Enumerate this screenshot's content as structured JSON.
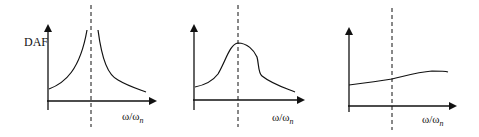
{
  "figure": {
    "panels": [
      {
        "id": "panel-1",
        "y_label": "DAF",
        "x_label": "ω/ω",
        "x_label_sub": "n",
        "description": "Undamped: DAF grows unbounded approaching resonance (ω/ωn = 1) from both sides"
      },
      {
        "id": "panel-2",
        "y_label": "",
        "x_label": "ω/ω",
        "x_label_sub": "n",
        "description": "Damped: finite peak at resonance"
      },
      {
        "id": "panel-3",
        "y_label": "",
        "x_label": "ω/ω",
        "x_label_sub": "n",
        "description": "Heavily damped: nearly flat, slowly rising curve"
      }
    ],
    "colors": {
      "ink": "#111111",
      "background": "#ffffff"
    }
  }
}
